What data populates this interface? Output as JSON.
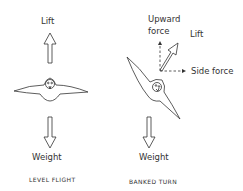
{
  "level_flight": {
    "lift_label": "Lift",
    "weight_label": "Weight",
    "caption": "LEVEL FLIGHT"
  },
  "banked_turn": {
    "upward_force_label_line1": "Upward",
    "upward_force_label_line2": "force",
    "lift_label": "Lift",
    "side_force_label": "Side force",
    "weight_label": "Weight",
    "caption": "BANKED TURN"
  }
}
